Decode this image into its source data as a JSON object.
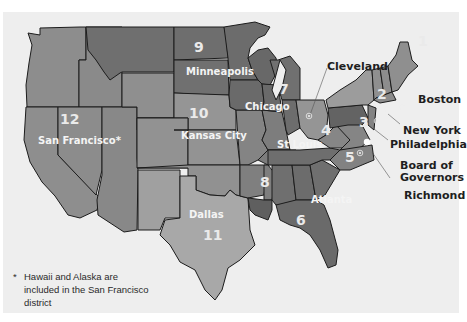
{
  "colors": {
    "background": "#eeeeee",
    "shade_dark": "#6f6f6f",
    "shade_mid": "#898989",
    "shade_light": "#a2a2a2",
    "shade_pale": "#bdbdbd",
    "border": "#1c1c1c",
    "label_dark": "#1e1e1e",
    "label_light": "#f4f4f4"
  },
  "districts": [
    {
      "number": "1",
      "city": "Boston"
    },
    {
      "number": "2",
      "city": "New York"
    },
    {
      "number": "3",
      "city": "Philadelphia"
    },
    {
      "number": "4",
      "city": "Cleveland"
    },
    {
      "number": "5",
      "city": "Richmond"
    },
    {
      "number": "6",
      "city": "Atlanta"
    },
    {
      "number": "7",
      "city": "Chicago"
    },
    {
      "number": "8",
      "city": "St Louis"
    },
    {
      "number": "9",
      "city": "Minneapolis"
    },
    {
      "number": "10",
      "city": "Kansas City"
    },
    {
      "number": "11",
      "city": "Dallas"
    },
    {
      "number": "12",
      "city": "San Francisco*"
    }
  ],
  "other_labels": {
    "board": "Board of Governors",
    "board_line1": "Board of",
    "board_line2": "Governors"
  },
  "footnote": {
    "marker": "*",
    "text": "Hawaii and Alaska are included in the San Francisco district"
  }
}
